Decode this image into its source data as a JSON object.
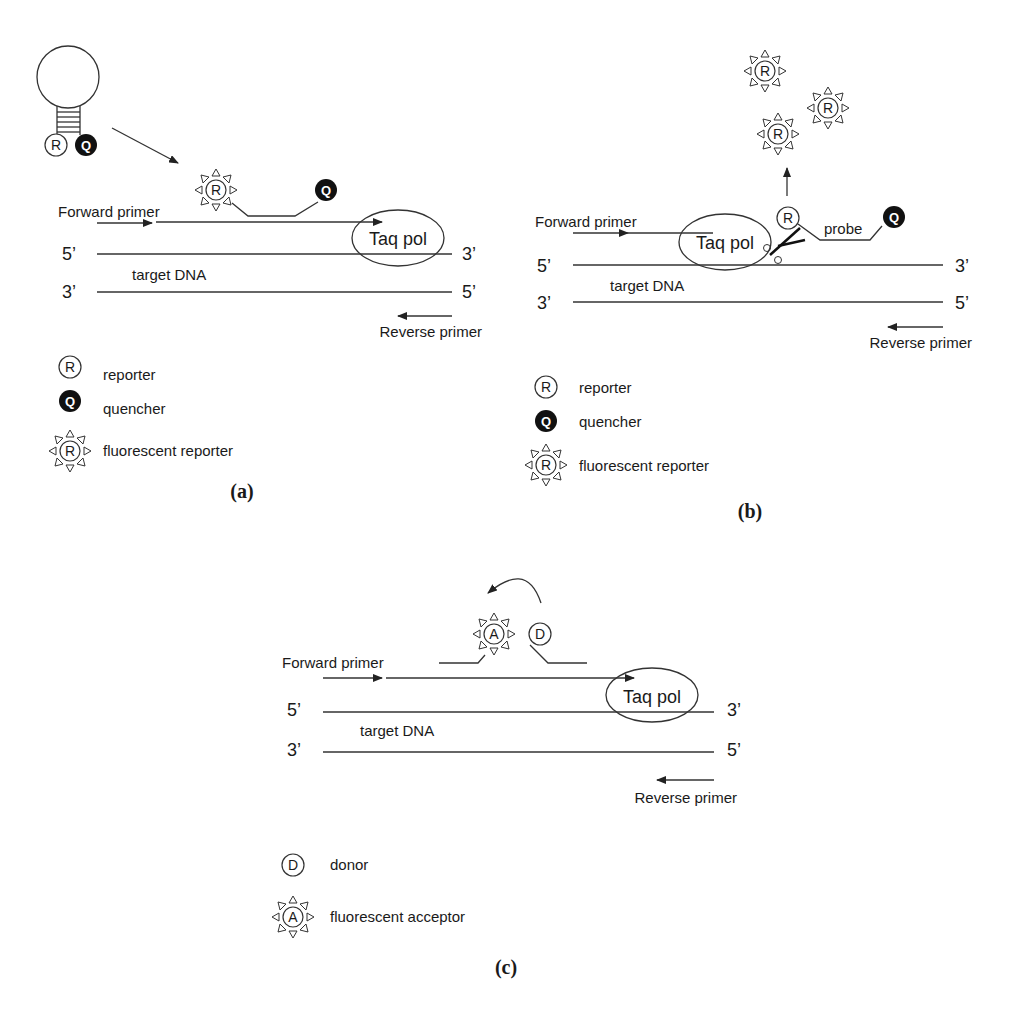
{
  "panels": {
    "a": {
      "caption": "(a)",
      "forward_primer": "Forward primer",
      "reverse_primer": "Reverse primer",
      "target_dna": "target DNA",
      "enzyme": "Taq pol",
      "top_5": "5’",
      "top_3": "3’",
      "bot_3": "3’",
      "bot_5": "5’",
      "reporter_glyph": "R",
      "quencher_glyph": "Q",
      "legend": [
        {
          "icon": "reporter-icon",
          "glyph": "R",
          "label": "reporter"
        },
        {
          "icon": "quencher-icon",
          "glyph": "Q",
          "label": "quencher"
        },
        {
          "icon": "fluorescent-reporter-icon",
          "glyph": "R",
          "label": "fluorescent reporter"
        }
      ]
    },
    "b": {
      "caption": "(b)",
      "forward_primer": "Forward primer",
      "reverse_primer": "Reverse primer",
      "target_dna": "target DNA",
      "enzyme": "Taq pol",
      "probe": "probe",
      "top_5": "5’",
      "top_3": "3’",
      "bot_3": "3’",
      "bot_5": "5’",
      "reporter_glyph": "R",
      "quencher_glyph": "Q",
      "legend": [
        {
          "icon": "reporter-icon",
          "glyph": "R",
          "label": "reporter"
        },
        {
          "icon": "quencher-icon",
          "glyph": "Q",
          "label": "quencher"
        },
        {
          "icon": "fluorescent-reporter-icon",
          "glyph": "R",
          "label": "fluorescent reporter"
        }
      ]
    },
    "c": {
      "caption": "(c)",
      "forward_primer": "Forward primer",
      "reverse_primer": "Reverse primer",
      "target_dna": "target DNA",
      "enzyme": "Taq pol",
      "top_5": "5’",
      "top_3": "3’",
      "bot_3": "3’",
      "bot_5": "5’",
      "acceptor_glyph": "A",
      "donor_glyph": "D",
      "legend": [
        {
          "icon": "donor-icon",
          "glyph": "D",
          "label": "donor"
        },
        {
          "icon": "fluorescent-acceptor-icon",
          "glyph": "A",
          "label": "fluorescent acceptor"
        }
      ]
    }
  }
}
